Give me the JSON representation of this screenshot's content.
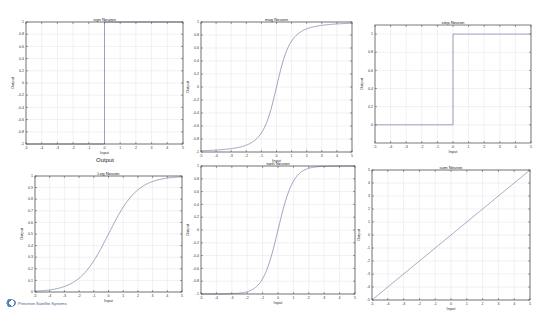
{
  "figure_title": "Output",
  "logo_text": "Princeton Satellite Systems",
  "chart_data": [
    {
      "type": "line",
      "title": "sign Neuron",
      "xlabel": "Input",
      "ylabel": "Output",
      "xlim": [
        -5,
        5
      ],
      "ylim": [
        -1,
        1
      ],
      "xticks": [
        -5,
        -4,
        -3,
        -2,
        -1,
        0,
        1,
        2,
        3,
        4,
        5
      ],
      "yticks": [
        -1,
        -0.8,
        -0.6,
        -0.4,
        -0.2,
        0,
        0.2,
        0.4,
        0.6,
        0.8,
        1
      ],
      "grid": true,
      "function": "sign",
      "x": [
        -5,
        0,
        0,
        5
      ],
      "y": [
        -1,
        -1,
        1,
        1
      ]
    },
    {
      "type": "line",
      "title": "mag Neuron",
      "xlabel": "Input",
      "ylabel": "Output",
      "xlim": [
        -5,
        5
      ],
      "ylim": [
        -1,
        1
      ],
      "xticks": [
        -5,
        -4,
        -3,
        -2,
        -1,
        0,
        1,
        2,
        3,
        4,
        5
      ],
      "yticks": [
        -1,
        -0.8,
        -0.6,
        -0.4,
        -0.2,
        0,
        0.2,
        0.4,
        0.6,
        0.8,
        1
      ],
      "grid": true,
      "function": "x/sqrt(1+x^2)",
      "x": [
        -5,
        -4,
        -3,
        -2,
        -1,
        0,
        1,
        2,
        3,
        4,
        5
      ],
      "y": [
        -0.98,
        -0.97,
        -0.95,
        -0.89,
        -0.71,
        0,
        0.71,
        0.89,
        0.95,
        0.97,
        0.98
      ]
    },
    {
      "type": "line",
      "title": "step Neuron",
      "xlabel": "Input",
      "ylabel": "Output",
      "xlim": [
        -5,
        5
      ],
      "ylim": [
        -0.2,
        1.1
      ],
      "xticks": [
        -5,
        -4,
        -3,
        -2,
        -1,
        0,
        1,
        2,
        3,
        4,
        5
      ],
      "yticks": [
        0,
        0.2,
        0.4,
        0.6,
        0.8,
        1
      ],
      "grid": true,
      "function": "step",
      "x": [
        -5,
        0,
        0,
        5
      ],
      "y": [
        0,
        0,
        1,
        1
      ]
    },
    {
      "type": "line",
      "title": "Log Neuron",
      "xlabel": "Input",
      "ylabel": "Output",
      "xlim": [
        -5,
        5
      ],
      "ylim": [
        0,
        1
      ],
      "xticks": [
        -5,
        -4,
        -3,
        -2,
        -1,
        0,
        1,
        2,
        3,
        4,
        5
      ],
      "yticks": [
        0,
        0.1,
        0.2,
        0.3,
        0.4,
        0.5,
        0.6,
        0.7,
        0.8,
        0.9,
        1
      ],
      "grid": true,
      "function": "1/(1+exp(-x))",
      "x": [
        -5,
        -4,
        -3,
        -2,
        -1,
        0,
        1,
        2,
        3,
        4,
        5
      ],
      "y": [
        0.007,
        0.018,
        0.047,
        0.119,
        0.269,
        0.5,
        0.731,
        0.881,
        0.953,
        0.982,
        0.993
      ]
    },
    {
      "type": "line",
      "title": "tanh Neuron",
      "xlabel": "Input",
      "ylabel": "Output",
      "xlim": [
        -5,
        5
      ],
      "ylim": [
        -1,
        1
      ],
      "xticks": [
        -5,
        -4,
        -3,
        -2,
        -1,
        0,
        1,
        2,
        3,
        4,
        5
      ],
      "yticks": [
        -1,
        -0.8,
        -0.6,
        -0.4,
        -0.2,
        0,
        0.2,
        0.4,
        0.6,
        0.8,
        1
      ],
      "grid": true,
      "function": "tanh",
      "x": [
        -5,
        -4,
        -3,
        -2,
        -1,
        0,
        1,
        2,
        3,
        4,
        5
      ],
      "y": [
        -1,
        -0.999,
        -0.995,
        -0.964,
        -0.762,
        0,
        0.762,
        0.964,
        0.995,
        0.999,
        1
      ]
    },
    {
      "type": "line",
      "title": "sum Neuron",
      "xlabel": "Input",
      "ylabel": "Output",
      "xlim": [
        -5,
        5
      ],
      "ylim": [
        -5,
        5
      ],
      "xticks": [
        -5,
        -4,
        -3,
        -2,
        -1,
        0,
        1,
        2,
        3,
        4,
        5
      ],
      "yticks": [
        -5,
        -4,
        -3,
        -2,
        -1,
        0,
        1,
        2,
        3,
        4,
        5
      ],
      "grid": true,
      "function": "linear",
      "x": [
        -5,
        5
      ],
      "y": [
        -5,
        5
      ]
    }
  ],
  "panels": [
    {
      "box": [
        26,
        22,
        157,
        122
      ]
    },
    {
      "box": [
        201,
        22,
        151,
        130
      ]
    },
    {
      "box": [
        375,
        25,
        156,
        118
      ]
    },
    {
      "box": [
        35,
        176,
        147,
        116
      ]
    },
    {
      "box": [
        201,
        166,
        154,
        128
      ]
    },
    {
      "box": [
        372,
        170,
        158,
        130
      ]
    }
  ],
  "colors": {
    "curve": "#7a7aa8",
    "axis": "#444444",
    "grid": "#e2e2e2",
    "background": "#ffffff"
  }
}
